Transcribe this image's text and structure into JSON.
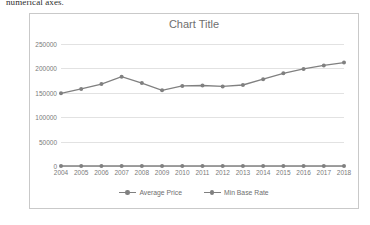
{
  "caption": "numerical axes.",
  "chart": {
    "title": "Chart Title",
    "legend": [
      {
        "label": "Average Price"
      },
      {
        "label": "Min Base Rate"
      }
    ],
    "accent_color": "#808080",
    "gridline_color": "#e2e2e2",
    "border_color": "#c9c9c9",
    "axis_text_color": "#7a7a7a"
  },
  "chart_data": {
    "type": "line",
    "title": "Chart Title",
    "xlabel": "",
    "ylabel": "",
    "categories": [
      "2004",
      "2005",
      "2006",
      "2007",
      "2008",
      "2009",
      "2010",
      "2011",
      "2012",
      "2013",
      "2014",
      "2015",
      "2016",
      "2017",
      "2018"
    ],
    "yticks": [
      0,
      50000,
      100000,
      150000,
      200000,
      250000
    ],
    "ytick_labels": [
      "0",
      "50000",
      "100000",
      "150000",
      "200000",
      "250000"
    ],
    "ylim": [
      0,
      250000
    ],
    "grid": true,
    "legend_position": "bottom",
    "series": [
      {
        "name": "Average Price",
        "values": [
          149000,
          158000,
          168000,
          183000,
          170000,
          155000,
          164000,
          165000,
          163000,
          166000,
          178000,
          190000,
          199000,
          206000,
          212000
        ]
      },
      {
        "name": "Min Base Rate",
        "values": [
          0,
          0,
          0,
          0,
          0,
          0,
          0,
          0,
          0,
          0,
          0,
          0,
          0,
          0,
          0
        ]
      }
    ]
  }
}
